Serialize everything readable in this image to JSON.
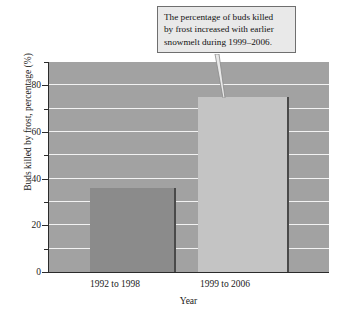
{
  "chart_data": {
    "type": "bar",
    "title": "",
    "subtitle": "",
    "xlabel": "Year",
    "ylabel": "Buds killed by frost, percentage (%)",
    "categories": [
      "1992 to 1998",
      "1999 to 2006"
    ],
    "values": [
      36,
      75
    ],
    "series": [
      {
        "name": "Buds killed by frost",
        "values": [
          36,
          75
        ]
      }
    ],
    "ylim": [
      0,
      90
    ],
    "ytick_labels": [
      "0",
      "20",
      "40",
      "60",
      "80"
    ],
    "ytick_values": [
      0,
      20,
      40,
      60,
      80
    ],
    "minor_tick_values": [
      10,
      30,
      50,
      70,
      90
    ],
    "gridline_values": [
      10,
      20,
      30,
      40,
      50,
      60,
      70,
      80,
      90
    ],
    "grid": true,
    "legend": "none",
    "legend_position": "none",
    "annotations": [
      {
        "text": "The percentage of buds killed by frost increased with earlier snowmelt during 1999–2006.",
        "points_to": "1999 to 2006"
      }
    ],
    "colors": {
      "plot_background": "#a2a2a2",
      "gridline": "#f2f2f2",
      "bar_1992_to_1998": "#8b8b8b",
      "bar_1999_to_2006": "#c4c4c4",
      "bar_edge": "#4a4a4a",
      "axis": "#2b2b2b",
      "callout_background": "#e9e9e9",
      "callout_border": "#6f6f6f",
      "text": "#1a1a1a"
    }
  },
  "callout": {
    "line1": "The percentage of buds killed",
    "line2": "by frost increased with earlier",
    "line3": "snowmelt during 1999–2006."
  }
}
